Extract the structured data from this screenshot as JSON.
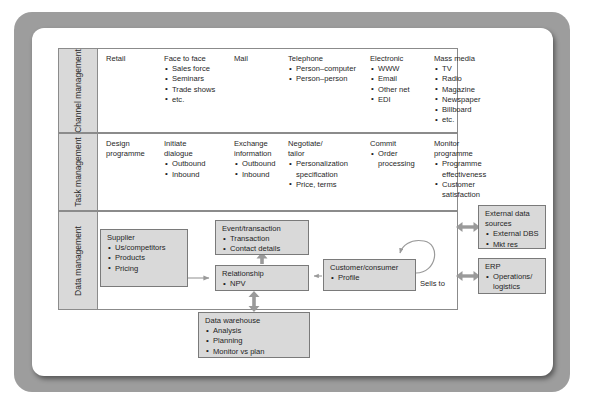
{
  "diagram": {
    "colors": {
      "page_background": "#ffffff",
      "frame": "#9d9d9d",
      "box_fill": "#d9d9d9",
      "box_border": "#7a7a7a",
      "grid_border": "#8b8b8b",
      "arrow": "#9a9a9a",
      "text": "#1f1f1f"
    },
    "rows": [
      {
        "id": "channel-management",
        "label": "Channel\nmanagement",
        "cells": [
          {
            "id": "retail",
            "heading": "Retail",
            "items": []
          },
          {
            "id": "face-to-face",
            "heading": "Face to face",
            "items": [
              "Sales force",
              "Seminars",
              "Trade shows",
              "etc."
            ]
          },
          {
            "id": "mail",
            "heading": "Mail",
            "items": []
          },
          {
            "id": "telephone",
            "heading": "Telephone",
            "items": [
              "Person–computer",
              "Person–person"
            ]
          },
          {
            "id": "electronic",
            "heading": "Electronic",
            "items": [
              "WWW",
              "Email",
              "Other net",
              "EDI"
            ]
          },
          {
            "id": "mass-media",
            "heading": "Mass media",
            "items": [
              "TV",
              "Radio",
              "Magazine",
              "Newspaper",
              "Billboard",
              "etc."
            ]
          }
        ]
      },
      {
        "id": "task-management",
        "label": "Task\nmanagement",
        "cells": [
          {
            "id": "design-programme",
            "heading": "Design\nprogramme",
            "items": []
          },
          {
            "id": "initiate-dialogue",
            "heading": "Initiate\ndialogue",
            "items": [
              "Outbound",
              "Inbound"
            ]
          },
          {
            "id": "exchange-information",
            "heading": "Exchange\ninformation",
            "items": [
              "Outbound",
              "Inbound"
            ]
          },
          {
            "id": "negotiate-tailor",
            "heading": "Negotiate/\ntailor",
            "items": [
              "Personalization\nspecification",
              "Price, terms"
            ]
          },
          {
            "id": "commit",
            "heading": "Commit",
            "items": [
              "Order\nprocessing"
            ]
          },
          {
            "id": "monitor-programme",
            "heading": "Monitor\nprogramme",
            "items": [
              "Programme\neffectiveness",
              "Customer\nsatisfaction"
            ]
          }
        ]
      },
      {
        "id": "data-management",
        "label": "Data\nmanagement",
        "cells": []
      }
    ],
    "data_boxes": [
      {
        "id": "supplier",
        "heading": "Supplier",
        "items": [
          "Us/competitors",
          "Products",
          "Pricing"
        ]
      },
      {
        "id": "event",
        "heading": "Event/transaction",
        "items": [
          "Transaction",
          "Contact details"
        ]
      },
      {
        "id": "relationship",
        "heading": "Relationship",
        "items": [
          "NPV"
        ]
      },
      {
        "id": "customer",
        "heading": "Customer/consumer",
        "items": [
          "Profile"
        ]
      },
      {
        "id": "warehouse",
        "heading": "Data warehouse",
        "items": [
          "Analysis",
          "Planning",
          "Monitor vs plan"
        ]
      },
      {
        "id": "external",
        "heading": "External data\nsources",
        "items": [
          "External DBS",
          "Mkt res"
        ]
      },
      {
        "id": "erp",
        "heading": "ERP",
        "items": [
          "Operations/\nlogistics"
        ]
      }
    ],
    "connector_labels": {
      "sells_to": "Sells to"
    }
  }
}
